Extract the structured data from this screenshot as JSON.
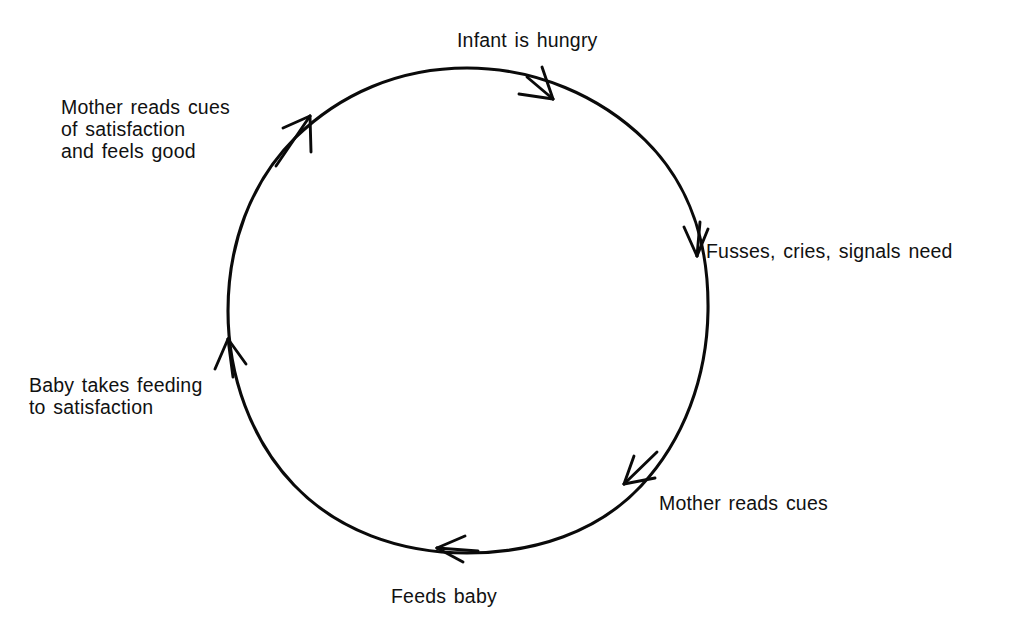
{
  "diagram": {
    "type": "cycle",
    "direction": "clockwise",
    "stroke_color": "#000000",
    "background_color": "#ffffff",
    "circle": {
      "center_x": 467,
      "center_y": 310,
      "radius": 242
    },
    "steps": [
      {
        "id": "infant-hungry",
        "label": "Infant is hungry",
        "angle_deg": -90,
        "label_position": "top"
      },
      {
        "id": "fusses-cries",
        "label": "Fusses, cries, signals need",
        "angle_deg": -18,
        "label_position": "right"
      },
      {
        "id": "mother-reads-cues",
        "label": "Mother reads cues",
        "angle_deg": 45,
        "label_position": "bottom-right"
      },
      {
        "id": "feeds-baby",
        "label": "Feeds baby",
        "angle_deg": 90,
        "label_position": "bottom"
      },
      {
        "id": "baby-takes-feeding",
        "label": "Baby takes feeding\nto satisfaction",
        "angle_deg": 170,
        "label_position": "left"
      },
      {
        "id": "mother-satisfaction",
        "label": "Mother reads cues\nof satisfaction\nand feels good",
        "angle_deg": -140,
        "label_position": "top-left"
      }
    ],
    "arrows": [
      {
        "id": "arrow-top",
        "at_step": "infant-hungry",
        "points": "clockwise"
      },
      {
        "id": "arrow-right",
        "at_step": "fusses-cries",
        "points": "clockwise"
      },
      {
        "id": "arrow-bottom-right",
        "at_step": "mother-reads-cues",
        "points": "clockwise"
      },
      {
        "id": "arrow-bottom",
        "at_step": "feeds-baby",
        "points": "clockwise"
      },
      {
        "id": "arrow-left",
        "at_step": "baby-takes-feeding",
        "points": "clockwise"
      },
      {
        "id": "arrow-top-left",
        "at_step": "mother-satisfaction",
        "points": "clockwise"
      }
    ]
  }
}
